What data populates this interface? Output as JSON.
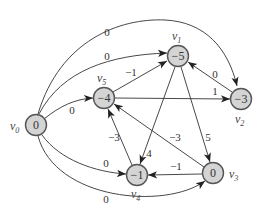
{
  "diagram": {
    "type": "directed-weighted-graph",
    "nodes": [
      {
        "id": "v0",
        "label": "v",
        "sub": "0",
        "value": "0",
        "x": 36,
        "y": 125,
        "lx": 10,
        "ly": 130
      },
      {
        "id": "v1",
        "label": "v",
        "sub": "1",
        "value": "−5",
        "x": 178,
        "y": 56,
        "lx": 172,
        "ly": 40
      },
      {
        "id": "v2",
        "label": "v",
        "sub": "2",
        "value": "−3",
        "x": 241,
        "y": 99,
        "lx": 236,
        "ly": 122
      },
      {
        "id": "v3",
        "label": "v",
        "sub": "3",
        "value": "0",
        "x": 213,
        "y": 173,
        "lx": 230,
        "ly": 178
      },
      {
        "id": "v4",
        "label": "v",
        "sub": "4",
        "value": "−1",
        "x": 137,
        "y": 175,
        "lx": 131,
        "ly": 197
      },
      {
        "id": "v5",
        "label": "v",
        "sub": "5",
        "value": "−4",
        "x": 104,
        "y": 98,
        "lx": 97,
        "ly": 82
      }
    ],
    "edges": [
      {
        "from": "v0",
        "to": "v2",
        "weight": "0",
        "wx": 107,
        "wy": 32
      },
      {
        "from": "v0",
        "to": "v1",
        "weight": "0",
        "wx": 107,
        "wy": 56
      },
      {
        "from": "v0",
        "to": "v5",
        "weight": "0",
        "wx": 72,
        "wy": 110
      },
      {
        "from": "v0",
        "to": "v4",
        "weight": "0",
        "wx": 106,
        "wy": 163
      },
      {
        "from": "v0",
        "to": "v3",
        "weight": "0",
        "wx": 106,
        "wy": 199
      },
      {
        "from": "v5",
        "to": "v1",
        "weight": "−1",
        "wx": 131,
        "wy": 72
      },
      {
        "from": "v5",
        "to": "v2",
        "weight": "1",
        "wx": 215,
        "wy": 91
      },
      {
        "from": "v2",
        "to": "v1",
        "weight": "0",
        "wx": 215,
        "wy": 74
      },
      {
        "from": "v1",
        "to": "v4",
        "weight": "4",
        "wx": 149,
        "wy": 153
      },
      {
        "from": "v1",
        "to": "v3",
        "weight": "5",
        "wx": 208,
        "wy": 137
      },
      {
        "from": "v3",
        "to": "v5",
        "weight": "−3",
        "wx": 175,
        "wy": 137
      },
      {
        "from": "v3",
        "to": "v4",
        "weight": "−1",
        "wx": 176,
        "wy": 166
      },
      {
        "from": "v4",
        "to": "v5",
        "weight": "−3",
        "wx": 114,
        "wy": 137
      }
    ]
  }
}
